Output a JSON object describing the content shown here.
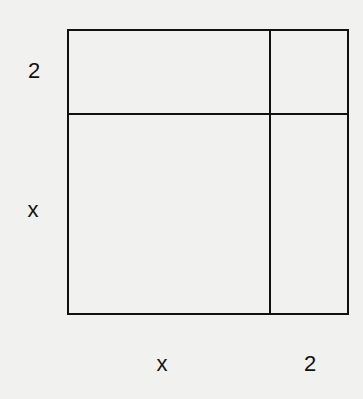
{
  "diagram": {
    "type": "area-model-square",
    "side_labels": {
      "left_top": "2",
      "left_bottom": "x",
      "bottom_left": "x",
      "bottom_right": "2"
    },
    "regions": [
      {
        "name": "top-left",
        "width": "x",
        "height": "2"
      },
      {
        "name": "top-right",
        "width": "2",
        "height": "2"
      },
      {
        "name": "bottom-left",
        "width": "x",
        "height": "x"
      },
      {
        "name": "bottom-right",
        "width": "2",
        "height": "x"
      }
    ],
    "line_color": "#111111",
    "background_color": "#f1f1f0"
  }
}
